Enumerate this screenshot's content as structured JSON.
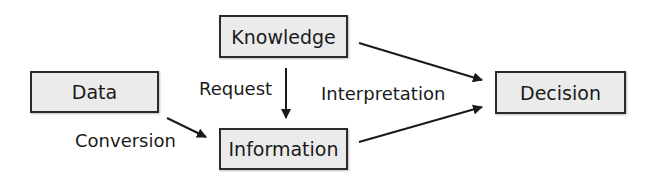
{
  "diagram": {
    "nodes": {
      "knowledge": "Knowledge",
      "data": "Data",
      "information": "Information",
      "decision": "Decision"
    },
    "edges": [
      {
        "from": "knowledge",
        "to": "information",
        "label": "Request"
      },
      {
        "from": "data",
        "to": "information",
        "label": "Conversion"
      },
      {
        "from": "knowledge",
        "to": "decision",
        "label": "Interpretation"
      },
      {
        "from": "information",
        "to": "decision",
        "label": "Interpretation"
      }
    ],
    "labels": {
      "request": "Request",
      "conversion": "Conversion",
      "interpretation": "Interpretation"
    }
  }
}
